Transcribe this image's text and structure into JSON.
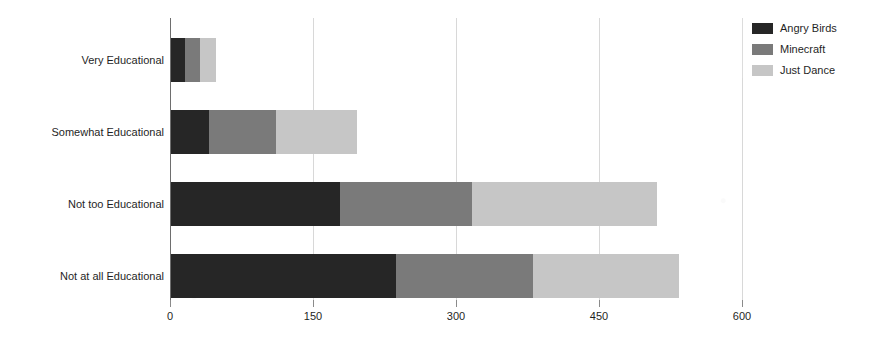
{
  "chart_data": {
    "type": "bar",
    "orientation": "horizontal",
    "stacked": true,
    "title": "",
    "xlabel": "",
    "ylabel": "",
    "xlim": [
      0,
      600
    ],
    "xticks": [
      0,
      150,
      300,
      450,
      600
    ],
    "xtick_labels": [
      "0",
      "150",
      "300",
      "450",
      "600"
    ],
    "grid": true,
    "grid_axis": "x",
    "legend_position": "right",
    "categories": [
      "Very Educational",
      "Somewhat Educational",
      "Not too Educational",
      "Not at all Educational"
    ],
    "series": [
      {
        "name": "Angry Birds",
        "color": "#262626",
        "values": [
          15,
          40,
          177,
          236
        ]
      },
      {
        "name": "Minecraft",
        "color": "#7a7a7a",
        "values": [
          15,
          70,
          139,
          144
        ]
      },
      {
        "name": "Just Dance",
        "color": "#c6c6c6",
        "values": [
          17,
          85,
          194,
          153
        ]
      }
    ],
    "totals": [
      47,
      195,
      510,
      533
    ]
  },
  "legend": {
    "items": [
      {
        "label": "Angry Birds",
        "swatch": "legend-swatch-angry-birds"
      },
      {
        "label": "Minecraft",
        "swatch": "legend-swatch-minecraft"
      },
      {
        "label": "Just Dance",
        "swatch": "legend-swatch-just-dance"
      }
    ]
  }
}
